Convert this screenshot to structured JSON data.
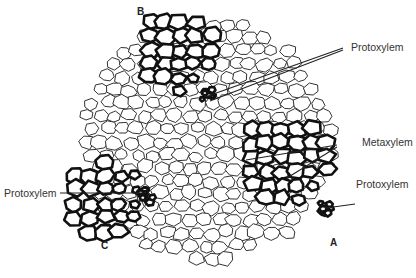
{
  "figure": {
    "labels": {
      "protoxylem_top": "Protoxylem",
      "metaxylem": "Metaxylem",
      "protoxylem_right": "Protoxylem",
      "protoxylem_left": "Protoxylem"
    },
    "bundle_letters": {
      "a": "A",
      "b": "B",
      "c": "C"
    },
    "colors": {
      "thin_wall": "#333333",
      "thick_wall": "#111111",
      "leader": "#222222",
      "text": "#333333"
    }
  }
}
